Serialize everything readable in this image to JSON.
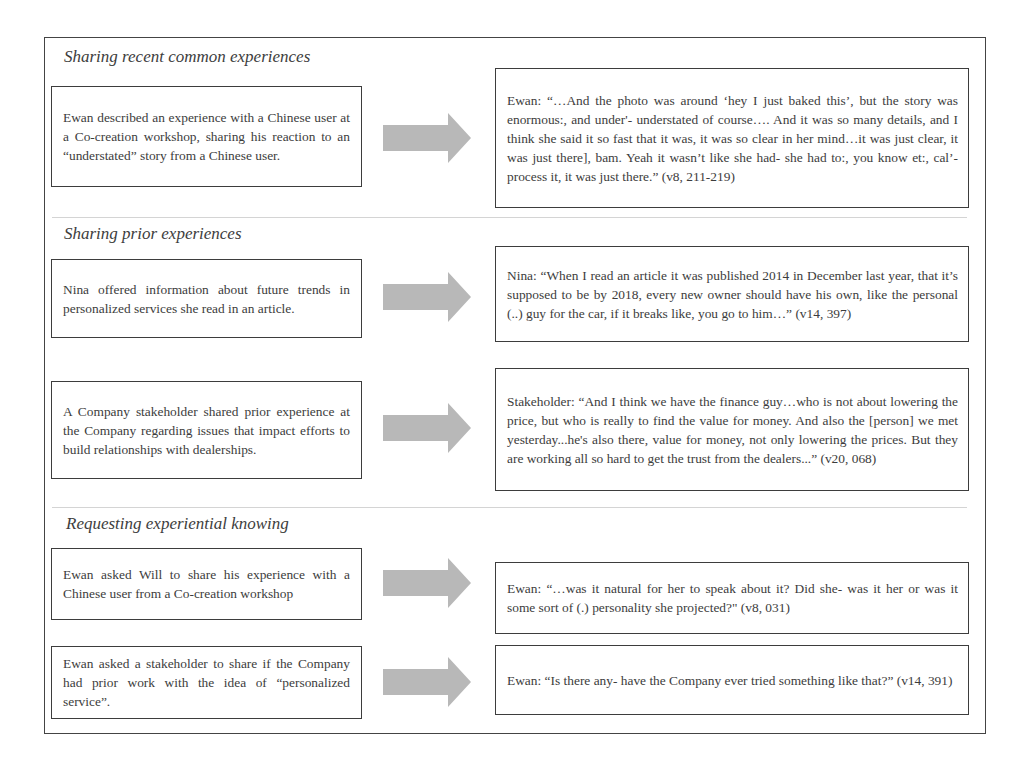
{
  "sections": [
    {
      "title": "Sharing recent common experiences",
      "rows": [
        {
          "description": "Ewan described an experience with a Chinese user at a Co-creation workshop, sharing his reaction to an “understated” story from a Chinese user.",
          "quote": "Ewan: “…And the photo was around ‘hey I just baked this’, but the story was enormous:, and under'- understated of course…. And it was so many details, and I think she said it so fast that it was, it was so clear in her mind…it was just clear, it was just there], bam.  Yeah it wasn’t like she had- she had to:, you know et:, cal’- process it, it was just there.”  (v8, 211-219)"
        }
      ]
    },
    {
      "title": "Sharing prior experiences",
      "rows": [
        {
          "description": "Nina offered information about future trends in personalized services she read in an article.",
          "quote": "Nina: “When I read an article it was published 2014 in December last year, that it’s supposed to be by 2018, every new owner should have his own, like the personal (..) guy for the car, if it breaks like, you go to him…” (v14, 397)"
        },
        {
          "description": "A Company stakeholder shared prior experience at the Company regarding issues that impact efforts to build relationships with dealerships.",
          "quote": "Stakeholder: “And I think we have the finance guy…who is not about lowering the price, but who is really to find the value for money. And also the [person] we met yesterday...he's also there, value for money, not only lowering the prices. But they are working all so hard to get the trust from the dealers...” (v20, 068)"
        }
      ]
    },
    {
      "title": "Requesting experiential knowing",
      "rows": [
        {
          "description": "Ewan asked Will to share his experience with a Chinese user from a Co-creation workshop",
          "quote": "Ewan: “…was it natural for her to speak about it?  Did she- was it her or was it some sort of (.) personality she projected?\" (v8, 031)"
        },
        {
          "description": "Ewan asked a stakeholder to share if the Company had prior work with the idea of “personalized service”.",
          "quote": "Ewan: “Is there any- have the Company ever tried something like that?” (v14, 391)"
        }
      ]
    }
  ],
  "colors": {
    "arrow": "#b8b8b8",
    "border": "#3d3d3d",
    "divider": "#d4d4d4"
  },
  "icons": {
    "arrow": "right-arrow-icon"
  }
}
